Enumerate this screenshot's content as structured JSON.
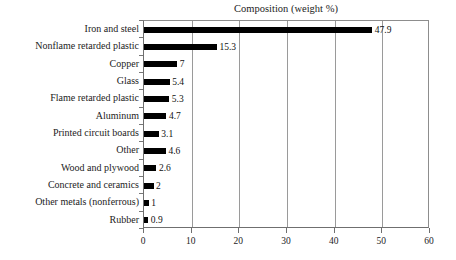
{
  "chart_data": {
    "type": "bar",
    "orientation": "horizontal",
    "title": "Composition (weight %)",
    "xlabel": "",
    "ylabel": "",
    "xlim": [
      0,
      60
    ],
    "xticks": [
      0,
      10,
      20,
      30,
      40,
      50,
      60
    ],
    "xtick_labels": [
      "0",
      "10",
      "20",
      "30",
      "40",
      "50",
      "60"
    ],
    "grid": true,
    "grid_axis": "x",
    "legend": false,
    "bar_color": "#000000",
    "categories": [
      "Iron and steel",
      "Nonflame retarded plastic",
      "Copper",
      "Glass",
      "Flame retarded plastic",
      "Aluminum",
      "Printed circuit boards",
      "Other",
      "Wood and plywood",
      "Concrete and ceramics",
      "Other metals (nonferrous)",
      "Rubber"
    ],
    "values": [
      47.9,
      15.3,
      7,
      5.4,
      5.3,
      4.7,
      3.1,
      4.6,
      2.6,
      2,
      1,
      0.9
    ],
    "value_labels": [
      "47.9",
      "15.3",
      "7",
      "5.4",
      "5.3",
      "4.7",
      "3.1",
      "4.6",
      "2.6",
      "2",
      "1",
      "0.9"
    ]
  }
}
